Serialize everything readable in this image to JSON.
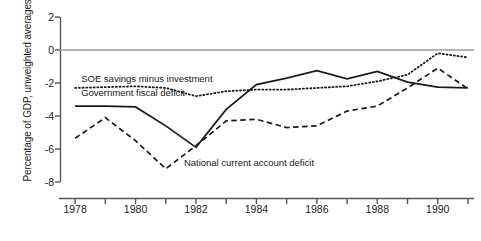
{
  "chart_data": {
    "type": "line",
    "title": "",
    "xlabel": "",
    "ylabel": "Percentage of GDP, unweighted averages",
    "xlim": [
      1977.5,
      1991.2
    ],
    "ylim": [
      -8,
      2
    ],
    "yticks": [
      2,
      0,
      -2,
      -4,
      -6,
      -8
    ],
    "ytick_labels": [
      "2",
      "0",
      "-2",
      "-4",
      "-6",
      "-8"
    ],
    "xticks": [
      1978,
      1979,
      1980,
      1981,
      1982,
      1983,
      1984,
      1985,
      1986,
      1987,
      1988,
      1989,
      1990,
      1991
    ],
    "xtick_labels_shown": [
      "1978",
      "1980",
      "1982",
      "1984",
      "1986",
      "1988",
      "1990"
    ],
    "xtick_labels_values": [
      1978,
      1980,
      1982,
      1984,
      1986,
      1988,
      1990
    ],
    "grid": false,
    "zero_line": true,
    "legend_position": "inline-annotations",
    "x": [
      1978,
      1979,
      1980,
      1981,
      1982,
      1983,
      1984,
      1985,
      1986,
      1987,
      1988,
      1989,
      1990,
      1991
    ],
    "series": [
      {
        "name": "SOE savings minus investment",
        "style": "dotted",
        "color": "#1a1a1a",
        "values": [
          -2.3,
          -2.25,
          -2.2,
          -2.3,
          -2.8,
          -2.5,
          -2.4,
          -2.4,
          -2.3,
          -2.2,
          -1.9,
          -1.5,
          -0.2,
          -0.45
        ]
      },
      {
        "name": "Government fiscal deficit",
        "style": "solid",
        "color": "#1a1a1a",
        "values": [
          -3.4,
          -3.4,
          -3.45,
          -4.6,
          -5.9,
          -3.6,
          -2.1,
          -1.7,
          -1.25,
          -1.75,
          -1.3,
          -1.95,
          -2.25,
          -2.3
        ]
      },
      {
        "name": "National current account deficit",
        "style": "dashed",
        "color": "#1a1a1a",
        "values": [
          -5.35,
          -4.1,
          -5.5,
          -7.2,
          -5.8,
          -4.3,
          -4.2,
          -4.7,
          -4.6,
          -3.7,
          -3.4,
          -2.3,
          -1.1,
          -2.35
        ]
      }
    ],
    "annotations": [
      {
        "text": "SOE savings minus investment",
        "x": 1978.2,
        "y": -1.75
      },
      {
        "text": "Government fiscal deficit",
        "x": 1978.2,
        "y": -2.6
      },
      {
        "text": "National current account deficit",
        "x": 1981.6,
        "y": -6.85
      }
    ]
  },
  "axis": {
    "ylabel": "Percentage of GDP, unweighted averages"
  }
}
